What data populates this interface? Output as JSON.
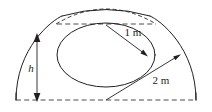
{
  "figure": {
    "name": "geometry-diagram-circular-segment",
    "background_color": "#ffffff",
    "line_color": "#231f20",
    "dashed_color": "#4d4d52",
    "labels": {
      "outer_radius": "2 m",
      "inner_radius": "1 m",
      "height": "h"
    },
    "geometry": {
      "outer_radius_value": 2,
      "inner_radius_value": 1,
      "units": "m",
      "height_symbol": "h",
      "center_x": 106,
      "baseline_y": 100,
      "chord_y": 24
    }
  }
}
